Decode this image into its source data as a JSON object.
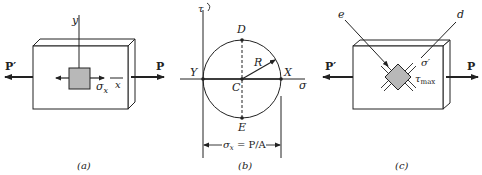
{
  "panels": {
    "a": {
      "caption": "(a)",
      "axis_y": "y",
      "axis_x": "x",
      "stress_label": "σ",
      "stress_sub": "x",
      "load_left": "P′",
      "load_right": "P"
    },
    "b": {
      "caption": "(b)",
      "tau_axis": "τ",
      "sigma_axis": "σ",
      "point_top": "D",
      "point_bottom": "E",
      "point_left": "Y",
      "point_right": "X",
      "center": "C",
      "radius": "R",
      "dimension": "σx = P/A",
      "dim_sigma": "σ",
      "dim_sub": "x",
      "dim_rest": " = P/A"
    },
    "c": {
      "caption": "(c)",
      "label_e": "e",
      "label_d": "d",
      "stress_normal": "σ′",
      "stress_shear": "τ",
      "stress_shear_sub": "max",
      "load_left": "P′",
      "load_right": "P"
    }
  },
  "colors": {
    "line": "#222222",
    "element_fill": "#b8b8b8",
    "plate_fill": "#ffffff"
  }
}
